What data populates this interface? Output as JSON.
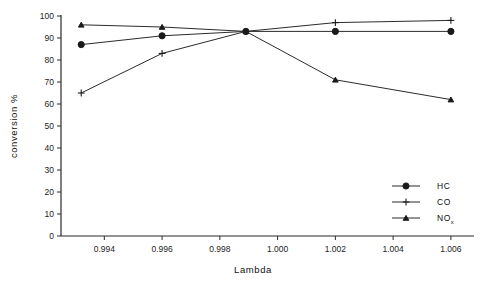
{
  "chart_data": {
    "type": "line",
    "title": "",
    "xlabel": "Lambda",
    "ylabel": "conversion %",
    "xlim": [
      0.9925,
      1.0068
    ],
    "ylim": [
      0,
      100
    ],
    "grid": false,
    "legend_position": "bottom-right",
    "x": [
      0.9932,
      0.996,
      0.9989,
      1.002,
      1.006
    ],
    "xticks": [
      "0.994",
      "0.996",
      "0.998",
      "1.000",
      "1.002",
      "1.004",
      "1.006"
    ],
    "xtick_values": [
      0.994,
      0.996,
      0.998,
      1.0,
      1.002,
      1.004,
      1.006
    ],
    "yticks": [
      "0",
      "10",
      "20",
      "30",
      "40",
      "50",
      "60",
      "70",
      "80",
      "90",
      "100"
    ],
    "ytick_values": [
      0,
      10,
      20,
      30,
      40,
      50,
      60,
      70,
      80,
      90,
      100
    ],
    "series": [
      {
        "name": "HC",
        "marker": "filled-circle",
        "values": [
          87,
          91,
          93,
          93,
          93
        ]
      },
      {
        "name": "CO",
        "marker": "plus",
        "values": [
          65,
          83,
          93,
          97,
          98
        ]
      },
      {
        "name": "NOx",
        "marker": "triangle",
        "values": [
          96,
          95,
          93,
          71,
          62
        ]
      }
    ],
    "legend": [
      {
        "label": "HC",
        "sub": "",
        "marker": "filled-circle"
      },
      {
        "label": "CO",
        "sub": "",
        "marker": "plus"
      },
      {
        "label": "NO",
        "sub": "x",
        "marker": "triangle"
      }
    ],
    "colors": {
      "line": "#2b2b2b",
      "marker": "#1a1a1a",
      "axis": "#2b2b2b",
      "background": "#ffffff"
    }
  }
}
